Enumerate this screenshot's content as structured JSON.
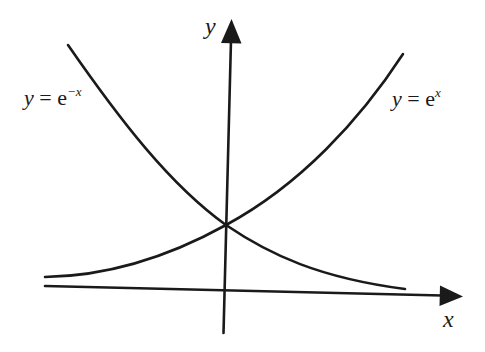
{
  "diagram": {
    "type": "function-graph",
    "axes": {
      "x_label": "x",
      "y_label": "y"
    },
    "curves": [
      {
        "id": "exp-neg-x",
        "label_prefix": "y = e",
        "label_exponent": "−x",
        "behavior": "decreasing, approaches x-axis as x increases"
      },
      {
        "id": "exp-x",
        "label_prefix": "y = e",
        "label_exponent": "x",
        "behavior": "increasing, approaches x-axis as x decreases"
      }
    ],
    "intersection": {
      "description": "Both curves cross the y-axis at the same point (0, 1)"
    },
    "colors": {
      "line": "#1a1a1a",
      "background": "#ffffff"
    }
  }
}
